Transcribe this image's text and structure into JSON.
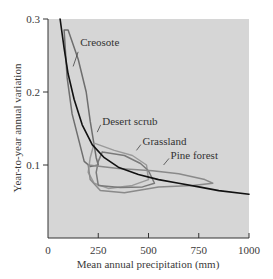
{
  "chart_data": {
    "type": "line",
    "title": "",
    "xlabel": "Mean annual precipitation (mm)",
    "ylabel": "Year-to-year annual variation",
    "xlim": [
      0,
      1000
    ],
    "ylim": [
      0,
      0.3
    ],
    "x_ticks": [
      0,
      250,
      500,
      750,
      1000
    ],
    "x_tick_labels": [
      "0",
      "250",
      "500",
      "750",
      "1000"
    ],
    "y_ticks": [
      0.1,
      0.2,
      0.3
    ],
    "y_tick_labels": [
      "0.1",
      "0.2",
      "0.3"
    ],
    "grid": false,
    "background": "#d6d6d6",
    "series": [
      {
        "name": "Trend curve",
        "kind": "line",
        "color": "#111111",
        "points": [
          [
            60,
            0.3
          ],
          [
            80,
            0.26
          ],
          [
            100,
            0.225
          ],
          [
            130,
            0.19
          ],
          [
            170,
            0.155
          ],
          [
            220,
            0.128
          ],
          [
            280,
            0.11
          ],
          [
            350,
            0.097
          ],
          [
            450,
            0.087
          ],
          [
            550,
            0.08
          ],
          [
            650,
            0.075
          ],
          [
            750,
            0.07
          ],
          [
            850,
            0.065
          ],
          [
            1000,
            0.06
          ]
        ]
      },
      {
        "name": "Creosote",
        "kind": "envelope",
        "color": "#6e6e6e",
        "points": [
          [
            80,
            0.285
          ],
          [
            100,
            0.285
          ],
          [
            150,
            0.245
          ],
          [
            190,
            0.2
          ],
          [
            210,
            0.16
          ],
          [
            240,
            0.11
          ],
          [
            250,
            0.1
          ],
          [
            210,
            0.098
          ],
          [
            180,
            0.105
          ],
          [
            120,
            0.17
          ],
          [
            95,
            0.22
          ],
          [
            80,
            0.285
          ]
        ]
      },
      {
        "name": "Desert scrub",
        "kind": "envelope",
        "color": "#9a9a9a",
        "points": [
          [
            230,
            0.13
          ],
          [
            330,
            0.12
          ],
          [
            420,
            0.113
          ],
          [
            490,
            0.1
          ],
          [
            500,
            0.08
          ],
          [
            420,
            0.072
          ],
          [
            300,
            0.068
          ],
          [
            230,
            0.075
          ],
          [
            200,
            0.09
          ],
          [
            210,
            0.11
          ],
          [
            230,
            0.13
          ]
        ]
      },
      {
        "name": "Grassland",
        "kind": "envelope",
        "color": "#7a7a7a",
        "points": [
          [
            270,
            0.118
          ],
          [
            380,
            0.113
          ],
          [
            460,
            0.102
          ],
          [
            500,
            0.092
          ],
          [
            530,
            0.075
          ],
          [
            470,
            0.07
          ],
          [
            360,
            0.069
          ],
          [
            250,
            0.072
          ],
          [
            240,
            0.09
          ],
          [
            250,
            0.105
          ],
          [
            270,
            0.118
          ]
        ]
      },
      {
        "name": "Pine forest",
        "kind": "envelope",
        "color": "#8a8a8a",
        "points": [
          [
            200,
            0.1
          ],
          [
            350,
            0.095
          ],
          [
            520,
            0.092
          ],
          [
            650,
            0.088
          ],
          [
            780,
            0.08
          ],
          [
            820,
            0.075
          ],
          [
            720,
            0.072
          ],
          [
            550,
            0.07
          ],
          [
            380,
            0.062
          ],
          [
            260,
            0.065
          ],
          [
            210,
            0.08
          ],
          [
            200,
            0.1
          ]
        ]
      }
    ],
    "annotations": [
      {
        "text": "Creosote",
        "x": 160,
        "y": 0.268
      },
      {
        "text": "Desert scrub",
        "x": 270,
        "y": 0.16
      },
      {
        "text": "Grassland",
        "x": 470,
        "y": 0.133
      },
      {
        "text": "Pine forest",
        "x": 610,
        "y": 0.114
      }
    ]
  }
}
